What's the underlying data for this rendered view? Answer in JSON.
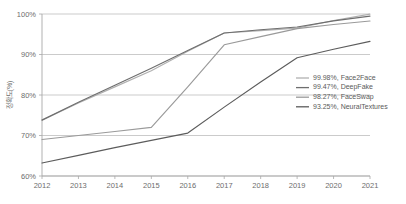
{
  "chart_data": {
    "type": "line",
    "title": "",
    "xlabel": "",
    "ylabel": "정확도(%)",
    "x": [
      2012,
      2013,
      2014,
      2015,
      2016,
      2017,
      2018,
      2019,
      2020,
      2021
    ],
    "categories": [
      "2012",
      "2013",
      "2014",
      "2015",
      "2016",
      "2017",
      "2018",
      "2019",
      "2020",
      "2021"
    ],
    "ylim": [
      60,
      100
    ],
    "yticks": [
      60,
      70,
      80,
      90,
      100
    ],
    "ytick_labels": [
      "60%",
      "70%",
      "80%",
      "90%",
      "100%"
    ],
    "grid": true,
    "legend_position": "inside-right",
    "series": [
      {
        "name": "Face2Face",
        "final_value": "99.98%",
        "legend_label": "99.98%, Face2Face",
        "color": "#b0b0b0",
        "values": [
          73.8,
          78.0,
          82.0,
          86.0,
          90.8,
          95.3,
          95.9,
          96.5,
          98.4,
          99.98
        ]
      },
      {
        "name": "DeepFake",
        "final_value": "99.47%",
        "legend_label": "99.47%, DeepFake",
        "color": "#6e6e6e",
        "values": [
          73.8,
          78.2,
          82.4,
          86.6,
          91.0,
          95.3,
          96.1,
          96.8,
          98.3,
          99.47
        ]
      },
      {
        "name": "FaceSwap",
        "final_value": "98.27%",
        "legend_label": "98.27%, FaceSwap",
        "color": "#9a9a9a",
        "values": [
          69.0,
          70.0,
          71.0,
          72.0,
          82.0,
          92.4,
          94.4,
          96.4,
          97.4,
          98.27
        ]
      },
      {
        "name": "NeuralTextures",
        "final_value": "93.25%",
        "legend_label": "93.25%, NeuralTextures",
        "color": "#5c5c5c",
        "values": [
          63.2,
          65.1,
          67.0,
          68.8,
          70.6,
          77.0,
          83.2,
          89.2,
          91.3,
          93.25
        ]
      }
    ]
  },
  "axes": {
    "frame_color": "#a8a8a8",
    "grid_color": "#b5b5b5",
    "tick_color": "#6d6d6d"
  }
}
